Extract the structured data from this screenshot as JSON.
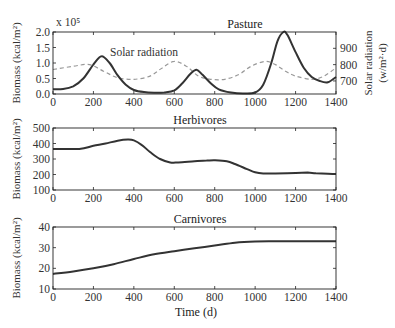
{
  "chart_data": [
    {
      "type": "line",
      "title": "Pasture",
      "xlabel": "",
      "ylabel": "Biomass (kcal/m²)",
      "y_multiplier": "x 10⁵",
      "ylim": [
        0,
        2.0
      ],
      "yticks": [
        "0.0",
        "0.5",
        "1.0",
        "1.5",
        "2.0"
      ],
      "y2label": "Solar radiation (w/m².d)",
      "y2lim": [
        620,
        1000
      ],
      "y2ticks": [
        "700",
        "800",
        "900"
      ],
      "xlim": [
        0,
        1400
      ],
      "xticks": [
        "0",
        "200",
        "400",
        "600",
        "800",
        "1000",
        "1200",
        "1400"
      ],
      "annotation": "Solar radiation",
      "series": [
        {
          "name": "Pasture biomass",
          "style": "solid",
          "x": [
            0,
            50,
            100,
            150,
            200,
            240,
            280,
            320,
            360,
            400,
            450,
            500,
            550,
            600,
            640,
            680,
            710,
            740,
            780,
            820,
            880,
            940,
            1000,
            1040,
            1080,
            1110,
            1140,
            1160,
            1200,
            1240,
            1280,
            1320,
            1360,
            1400
          ],
          "values": [
            0.15,
            0.16,
            0.25,
            0.5,
            0.95,
            1.22,
            1.0,
            0.6,
            0.3,
            0.13,
            0.06,
            0.04,
            0.05,
            0.12,
            0.35,
            0.65,
            0.78,
            0.62,
            0.35,
            0.15,
            0.05,
            0.02,
            0.05,
            0.3,
            1.0,
            1.7,
            2.0,
            1.9,
            1.35,
            0.85,
            0.55,
            0.42,
            0.38,
            0.55
          ]
        },
        {
          "name": "Solar radiation",
          "style": "dashed",
          "axis": "right",
          "x": [
            0,
            100,
            180,
            250,
            320,
            400,
            480,
            540,
            600,
            660,
            720,
            780,
            850,
            920,
            980,
            1050,
            1100,
            1150,
            1200,
            1280,
            1340,
            1400
          ],
          "values": [
            770,
            790,
            800,
            760,
            720,
            710,
            730,
            780,
            820,
            790,
            730,
            710,
            710,
            740,
            790,
            820,
            800,
            760,
            730,
            710,
            730,
            780
          ]
        }
      ]
    },
    {
      "type": "line",
      "title": "Herbivores",
      "ylabel": "Biomass (kcal/m²)",
      "ylim": [
        100,
        500
      ],
      "yticks": [
        "100",
        "200",
        "300",
        "400",
        "500"
      ],
      "xlim": [
        0,
        1400
      ],
      "xticks": [
        "0",
        "200",
        "400",
        "600",
        "800",
        "1000",
        "1200",
        "1400"
      ],
      "series": [
        {
          "name": "Herbivores",
          "x": [
            0,
            130,
            200,
            260,
            320,
            370,
            400,
            440,
            480,
            530,
            580,
            620,
            700,
            760,
            800,
            860,
            900,
            960,
            1000,
            1040,
            1100,
            1200,
            1260,
            1300,
            1360,
            1400
          ],
          "values": [
            365,
            365,
            385,
            400,
            418,
            425,
            420,
            390,
            345,
            300,
            278,
            278,
            285,
            290,
            292,
            285,
            268,
            235,
            215,
            207,
            207,
            210,
            212,
            208,
            205,
            203
          ]
        }
      ]
    },
    {
      "type": "line",
      "title": "Carnivores",
      "xlabel": "Time (d)",
      "ylabel": "Biomass (kcal/m²)",
      "ylim": [
        10,
        40
      ],
      "yticks": [
        "10",
        "20",
        "30",
        "40"
      ],
      "xlim": [
        0,
        1400
      ],
      "xticks": [
        "0",
        "200",
        "400",
        "600",
        "800",
        "1000",
        "1200",
        "1400"
      ],
      "series": [
        {
          "name": "Carnivores",
          "x": [
            0,
            100,
            200,
            300,
            400,
            500,
            600,
            700,
            800,
            900,
            1000,
            1100,
            1200,
            1300,
            1400
          ],
          "values": [
            17.3,
            18.5,
            20,
            22,
            24.5,
            26.8,
            28.3,
            29.7,
            31,
            32.4,
            33,
            33.1,
            33.1,
            33.1,
            33.1
          ]
        }
      ]
    }
  ]
}
